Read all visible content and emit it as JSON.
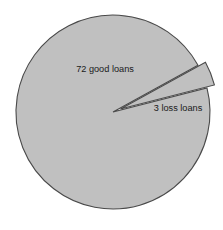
{
  "chart_data": {
    "type": "pie",
    "title": "",
    "subtitle": "",
    "xlabel": "",
    "ylabel": "",
    "legend": "none",
    "grid": false,
    "total": 75,
    "units": "loans",
    "categories": [
      "good loans",
      "loss loans"
    ],
    "values": [
      72,
      3
    ],
    "labels": [
      "72 good loans",
      "3 loss loans"
    ],
    "percentages": [
      96.0,
      4.0
    ],
    "slice_colors": [
      "#c0c0c0",
      "#c0c0c0"
    ],
    "edge_color": "#4a4a4a",
    "background_color": "#ffffff",
    "exploded": [
      false,
      true
    ],
    "explode_offset_px": 8,
    "start_angle_deg": -14.4,
    "counterclockwise": false,
    "geometry": {
      "center_x": 113,
      "center_y": 112,
      "radius": 97
    },
    "slices": [
      {
        "name": "good loans",
        "label": "72 good loans",
        "value": 72,
        "percent": 96.0,
        "angle_deg": 345.6,
        "color": "#c0c0c0",
        "exploded": false,
        "label_x": 105,
        "label_y": 70
      },
      {
        "name": "loss loans",
        "label": "3 loss loans",
        "value": 3,
        "percent": 4.0,
        "angle_deg": 14.4,
        "color": "#c0c0c0",
        "exploded": true,
        "label_x": 178,
        "label_y": 109
      }
    ]
  }
}
